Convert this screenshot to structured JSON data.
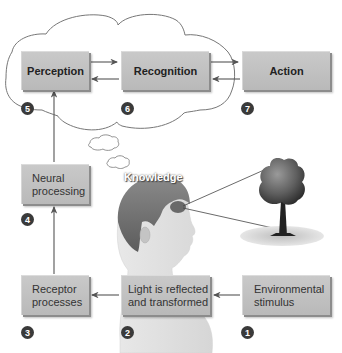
{
  "diagram": {
    "stages": [
      {
        "id": 1,
        "label_line1": "Environmental",
        "label_line2": "stimulus"
      },
      {
        "id": 2,
        "label_line1": "Light is reflected",
        "label_line2": "and transformed"
      },
      {
        "id": 3,
        "label_line1": "Receptor",
        "label_line2": "processes"
      },
      {
        "id": 4,
        "label_line1": "Neural",
        "label_line2": "processing"
      },
      {
        "id": 5,
        "label": "Perception"
      },
      {
        "id": 6,
        "label": "Recognition"
      },
      {
        "id": 7,
        "label": "Action"
      }
    ],
    "badges": [
      "1",
      "2",
      "3",
      "4",
      "5",
      "6",
      "7"
    ],
    "knowledge_label": "Knowledge",
    "illustrations": {
      "head": "person-profile",
      "object": "tree"
    },
    "colors": {
      "box_fill": "#c2c2c2",
      "badge": "#3a3a3a",
      "arrow": "#555555",
      "cloud_stroke": "#777777"
    }
  }
}
